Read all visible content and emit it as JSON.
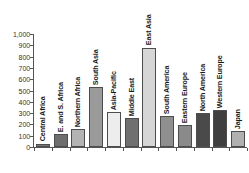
{
  "chart_data": {
    "type": "bar",
    "title": "",
    "subtitle": "",
    "xlabel": "",
    "ylabel": "",
    "ylim": [
      0,
      1000
    ],
    "grid": false,
    "legend": "none",
    "categories": [
      "Central Africa",
      "E. and S. Africa",
      "Northern Africa",
      "South Asia",
      "Asia-Pacific",
      "Middle East",
      "East Asia",
      "South America",
      "Eastern Europe",
      "North America",
      "Western Europe",
      "Japan"
    ],
    "values": [
      30,
      115,
      160,
      530,
      310,
      255,
      880,
      275,
      195,
      300,
      325,
      140
    ],
    "bar_colors": [
      "#7a7a7a",
      "#6e6e6e",
      "#b3b3b3",
      "#9a9a9a",
      "#ededed",
      "#707070",
      "#d6d6d6",
      "#8f8f8f",
      "#8a8a8a",
      "#4a4a4a",
      "#3f3f3f",
      "#b0b0b0"
    ],
    "ytick_labels": [
      "1,000",
      "900",
      "800",
      "700",
      "600",
      "500",
      "400",
      "300",
      "200",
      "100",
      "0"
    ],
    "ytick_values": [
      1000,
      900,
      800,
      700,
      600,
      500,
      400,
      300,
      200,
      100,
      0
    ],
    "axis_color": "#555555"
  }
}
